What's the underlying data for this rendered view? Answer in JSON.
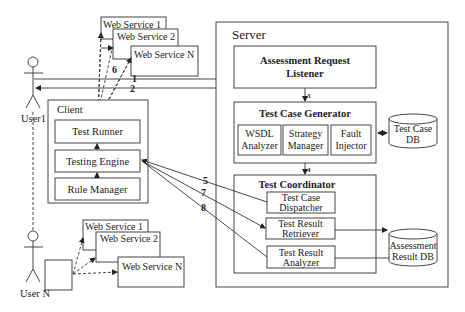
{
  "actors": {
    "user1": "User1",
    "userN": "User N"
  },
  "web_services_top": [
    "Web Service  1",
    "Web Service  2",
    "Web Service N"
  ],
  "web_services_bottom": [
    "Web Service  1",
    "Web Service  2",
    "Web Service N"
  ],
  "client": {
    "title": "Client",
    "components": [
      "Test Runner",
      "Testing Engine",
      "Rule Manager"
    ]
  },
  "server": {
    "title": "Server",
    "listener": [
      "Assessment Request",
      "Listener"
    ],
    "generator": {
      "title": "Test Case Generator",
      "parts": [
        [
          "WSDL",
          "Analyzer"
        ],
        [
          "Strategy",
          "Manager"
        ],
        [
          "Fault",
          "Injector"
        ]
      ]
    },
    "coordinator": {
      "title": "Test Coordinator",
      "parts": [
        [
          "Test Case",
          "Dispatcher"
        ],
        [
          "Test Result",
          "Retriever"
        ],
        [
          "Test Result",
          "Analyzer"
        ]
      ]
    }
  },
  "databases": {
    "test_case_db": [
      "Test Case",
      "DB"
    ],
    "result_db": [
      "Assessment",
      "Result DB"
    ]
  },
  "step_numbers": {
    "s1": "1",
    "s2": "2",
    "s3": "3",
    "s4": "4",
    "s5": "5",
    "s6": "6",
    "s7": "7",
    "s8": "8"
  }
}
